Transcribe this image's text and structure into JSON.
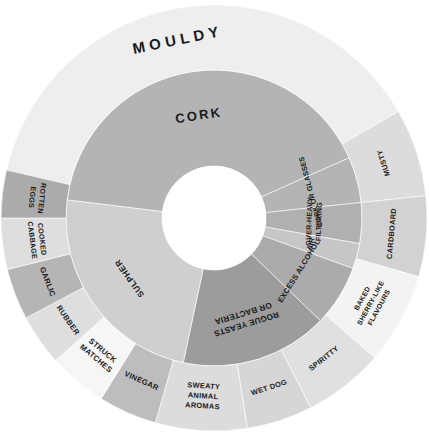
{
  "figure": {
    "type": "sunburst",
    "center": {
      "x": 214,
      "y": 218
    },
    "radii": {
      "hub": 52,
      "inner_ring_outer": 148,
      "outer_ring_outer": 213
    },
    "background": "#ffffff"
  },
  "palette": {
    "darkest": "#989898",
    "dark": "#a8a8a8",
    "mid": "#b8b8b8",
    "light": "#c9c9c9",
    "lighter": "#d9d9d9",
    "lightest": "#e8e8e8",
    "near_white": "#f2f2f2",
    "white": "#fafafa",
    "text": "#1a1a1a",
    "stroke": "#ffffff"
  },
  "chart_data": {
    "type": "pie",
    "subtitle": "",
    "xlabel": "",
    "ylabel": "",
    "legend_position": "none",
    "grid": false,
    "rings": [
      {
        "name": "inner",
        "level": 1,
        "radius_inner": 52,
        "radius_outer": 148,
        "segments": [
          {
            "label": "CORK",
            "start_deg": -83,
            "end_deg": 66,
            "color": "#b4b4b4",
            "label_style": "radial-out",
            "label_radius": 104,
            "font_size": 13,
            "letter_spacing": 2.2
          },
          {
            "label": "CORK OR GLASSES",
            "start_deg": 66,
            "end_deg": 84,
            "color": "#b4b4b4",
            "label_style": "radial-in",
            "label_radius": 100,
            "font_size": 7.2,
            "letter_spacing": 0.2
          },
          {
            "label": "OVER-HEAVY FILTERING",
            "start_deg": 84,
            "end_deg": 100,
            "color": "#b0b0b0",
            "label_style": "radial-in",
            "label_radius": 100,
            "font_size": 7.2,
            "letter_spacing": 0.2,
            "two_line": true
          },
          {
            "label": "AIR",
            "start_deg": 100,
            "end_deg": 110,
            "color": "#c6c6c6",
            "label_style": "radial-in",
            "label_radius": 100,
            "font_size": 7.2,
            "letter_spacing": 0.2
          },
          {
            "label": "EXCESS ALCOHOL",
            "start_deg": 110,
            "end_deg": 134,
            "color": "#ababab",
            "label_style": "radial-in",
            "label_radius": 100,
            "font_size": 7.6,
            "letter_spacing": 0.2
          },
          {
            "label": "ROGUE YEASTS OR BACTERIA",
            "start_deg": 134,
            "end_deg": 192,
            "color": "#9c9c9c",
            "label_style": "radial-out",
            "label_radius": 100,
            "font_size": 8.2,
            "letter_spacing": 0.2,
            "three_line": true
          },
          {
            "label": "SULPHER",
            "start_deg": 192,
            "end_deg": 277,
            "color": "#cfcfcf",
            "label_style": "radial-out",
            "label_radius": 104,
            "font_size": 8.4,
            "letter_spacing": 0.6
          }
        ]
      },
      {
        "name": "outer",
        "level": 2,
        "radius_inner": 148,
        "radius_outer": 213,
        "segments": [
          {
            "label": "MOULDY",
            "start_deg": -83,
            "end_deg": 60,
            "color": "#eeeeee",
            "label_style": "radial-out",
            "label_radius": 182,
            "font_size": 15,
            "letter_spacing": 4.5
          },
          {
            "label": "MUSTY",
            "start_deg": 60,
            "end_deg": 84,
            "color": "#dcdcdc",
            "label_style": "radial-in",
            "label_radius": 178,
            "font_size": 7.4,
            "letter_spacing": 0.3
          },
          {
            "label": "CARDBOARD",
            "start_deg": 84,
            "end_deg": 106,
            "color": "#d2d2d2",
            "label_style": "radial-in",
            "label_radius": 178,
            "font_size": 7.4,
            "letter_spacing": 0.3
          },
          {
            "label": "BAKED SHERRY-LIKE FLAVOURS",
            "start_deg": 106,
            "end_deg": 131,
            "color": "#f3f3f3",
            "label_style": "radial-in",
            "label_radius": 178,
            "font_size": 7.0,
            "letter_spacing": 0.2,
            "three_line": true
          },
          {
            "label": "SPIRITTY",
            "start_deg": 131,
            "end_deg": 153,
            "color": "#e0e0e0",
            "label_style": "radial-in",
            "label_radius": 178,
            "font_size": 7.4,
            "letter_spacing": 0.3
          },
          {
            "label": "WET DOG",
            "start_deg": 153,
            "end_deg": 171,
            "color": "#d6d6d6",
            "label_style": "radial-in",
            "label_radius": 178,
            "font_size": 7.4,
            "letter_spacing": 0.3
          },
          {
            "label": "SWEATY ANIMAL AROMAS",
            "start_deg": 171,
            "end_deg": 196,
            "color": "#dcdcdc",
            "label_style": "radial-in",
            "label_radius": 178,
            "font_size": 7.4,
            "letter_spacing": 0.3,
            "three_line": true
          },
          {
            "label": "VINEGAR",
            "start_deg": 196,
            "end_deg": 212,
            "color": "#bdbdbd",
            "label_style": "radial-in",
            "label_radius": 178,
            "font_size": 7.6,
            "letter_spacing": 0.3
          },
          {
            "label": "STRUCK MATCHES",
            "start_deg": 212,
            "end_deg": 228,
            "color": "#f6f6f6",
            "label_style": "radial-in",
            "label_radius": 178,
            "font_size": 7.6,
            "letter_spacing": 0.3,
            "two_line": true
          },
          {
            "label": "RUBBER",
            "start_deg": 228,
            "end_deg": 242,
            "color": "#dedede",
            "label_style": "radial-in",
            "label_radius": 178,
            "font_size": 7.6,
            "letter_spacing": 0.3
          },
          {
            "label": "GARLIC",
            "start_deg": 242,
            "end_deg": 256,
            "color": "#b5b5b5",
            "label_style": "radial-in",
            "label_radius": 178,
            "font_size": 7.6,
            "letter_spacing": 0.3
          },
          {
            "label": "COOKED CABBAGE",
            "start_deg": 256,
            "end_deg": 270,
            "color": "#dedede",
            "label_style": "radial-in",
            "label_radius": 178,
            "font_size": 7.2,
            "letter_spacing": 0.2,
            "two_line": true
          },
          {
            "label": "ROTTEN EGGS",
            "start_deg": 270,
            "end_deg": 283,
            "color": "#ababab",
            "label_style": "radial-in",
            "label_radius": 178,
            "font_size": 7.2,
            "letter_spacing": 0.2,
            "two_line": true
          }
        ]
      }
    ]
  }
}
